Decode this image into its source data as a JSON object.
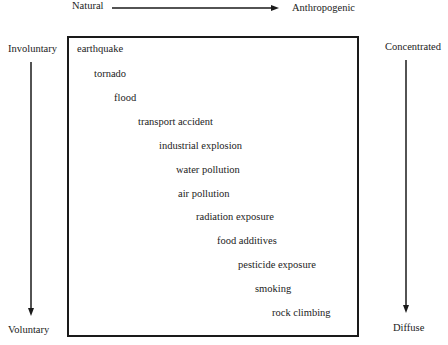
{
  "axes": {
    "top_left": "Natural",
    "top_right": "Anthropogenic",
    "left_top": "Involuntary",
    "left_bottom": "Voluntary",
    "right_top": "Concentrated",
    "right_bottom": "Diffuse"
  },
  "items": [
    {
      "label": "earthquake",
      "x": 77,
      "y": 44
    },
    {
      "label": "tornado",
      "x": 94,
      "y": 69
    },
    {
      "label": "flood",
      "x": 114,
      "y": 93
    },
    {
      "label": "transport accident",
      "x": 138,
      "y": 117
    },
    {
      "label": "industrial explosion",
      "x": 159,
      "y": 141
    },
    {
      "label": "water pollution",
      "x": 176,
      "y": 165
    },
    {
      "label": "air pollution",
      "x": 178,
      "y": 189
    },
    {
      "label": "radiation exposure",
      "x": 196,
      "y": 212
    },
    {
      "label": "food additives",
      "x": 217,
      "y": 236
    },
    {
      "label": "pesticide exposure",
      "x": 238,
      "y": 260
    },
    {
      "label": "smoking",
      "x": 255,
      "y": 284
    },
    {
      "label": "rock climbing",
      "x": 272,
      "y": 308
    }
  ]
}
